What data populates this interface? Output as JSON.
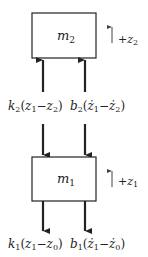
{
  "diagram": {
    "title": "",
    "colors": {
      "stroke": "#222222",
      "background": "#ffffff"
    },
    "masses": [
      {
        "id": "m2",
        "label_base": "m",
        "label_sub": "2"
      },
      {
        "id": "m1",
        "label_base": "m",
        "label_sub": "1"
      }
    ],
    "direction_indicators": [
      {
        "for": "m2",
        "sign": "+",
        "var_base": "z",
        "var_sub": "2",
        "direction": "up"
      },
      {
        "for": "m1",
        "sign": "+",
        "var_base": "z",
        "var_sub": "1",
        "direction": "up"
      }
    ],
    "forces_between": {
      "spring": {
        "coef_base": "k",
        "coef_sub": "2",
        "open": "(",
        "a_base": "z",
        "a_sub": "1",
        "minus": "−",
        "b_base": "z",
        "b_sub": "2",
        "close": ")",
        "text": "k2(z1−z2)"
      },
      "damper": {
        "coef_base": "b",
        "coef_sub": "2",
        "open": "(",
        "a_base": "ż",
        "a_sub": "1",
        "minus": "−",
        "b_base": "ż",
        "b_sub": "2",
        "close": ")",
        "text": "b2(ż1−ż2)"
      }
    },
    "forces_bottom": {
      "spring": {
        "coef_base": "k",
        "coef_sub": "1",
        "open": "(",
        "a_base": "z",
        "a_sub": "1",
        "minus": "−",
        "b_base": "z",
        "b_sub": "0",
        "close": ")",
        "text": "k1(z1−z0)"
      },
      "damper": {
        "coef_base": "b",
        "coef_sub": "1",
        "open": "(",
        "a_base": "ż",
        "a_sub": "1",
        "minus": "−",
        "b_base": "ż",
        "b_sub": "0",
        "close": ")",
        "text": "b1(ż1−ż0)"
      }
    }
  }
}
